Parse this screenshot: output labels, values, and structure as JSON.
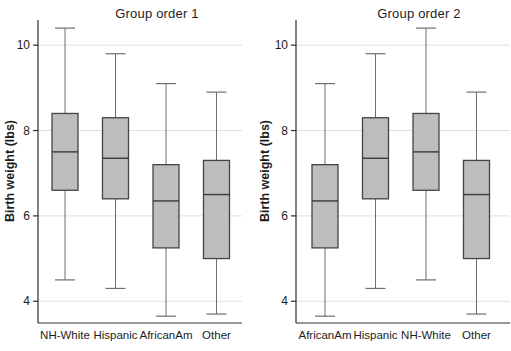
{
  "figure": {
    "background": "#ffffff",
    "box_fill": "#bdbdbd",
    "box_border": "#444444",
    "median_color": "#3a3a3a",
    "whisker_color": "#6e6e6e",
    "gridline_color": "#dfdfdf",
    "axis_color": "#2e2e2e",
    "text_color": "#1d1d1d"
  },
  "chart_data": [
    {
      "type": "box",
      "title": "Group order 1",
      "ylabel": "Birth weight (lbs)",
      "xlabel": "",
      "ylim": [
        3.49,
        10.59
      ],
      "yticks": [
        4,
        6,
        8,
        10
      ],
      "grid": true,
      "legend": "none",
      "categories": [
        "NH-White",
        "Hispanic",
        "AfricanAm",
        "Other"
      ],
      "boxes": [
        {
          "category": "NH-White",
          "min": 4.5,
          "q1": 6.6,
          "median": 7.5,
          "q3": 8.4,
          "max": 10.4
        },
        {
          "category": "Hispanic",
          "min": 4.3,
          "q1": 6.4,
          "median": 7.35,
          "q3": 8.3,
          "max": 9.8
        },
        {
          "category": "AfricanAm",
          "min": 3.65,
          "q1": 5.25,
          "median": 6.35,
          "q3": 7.2,
          "max": 9.1
        },
        {
          "category": "Other",
          "min": 3.7,
          "q1": 5.0,
          "median": 6.5,
          "q3": 7.3,
          "max": 8.9
        }
      ]
    },
    {
      "type": "box",
      "title": "Group order 2",
      "ylabel": "Birth weight (lbs)",
      "xlabel": "",
      "ylim": [
        3.49,
        10.59
      ],
      "yticks": [
        4,
        6,
        8,
        10
      ],
      "grid": true,
      "legend": "none",
      "categories": [
        "AfricanAm",
        "Hispanic",
        "NH-White",
        "Other"
      ],
      "boxes": [
        {
          "category": "AfricanAm",
          "min": 3.65,
          "q1": 5.25,
          "median": 6.35,
          "q3": 7.2,
          "max": 9.1
        },
        {
          "category": "Hispanic",
          "min": 4.3,
          "q1": 6.4,
          "median": 7.35,
          "q3": 8.3,
          "max": 9.8
        },
        {
          "category": "NH-White",
          "min": 4.5,
          "q1": 6.6,
          "median": 7.5,
          "q3": 8.4,
          "max": 10.4
        },
        {
          "category": "Other",
          "min": 3.7,
          "q1": 5.0,
          "median": 6.5,
          "q3": 7.3,
          "max": 8.9
        }
      ]
    }
  ]
}
